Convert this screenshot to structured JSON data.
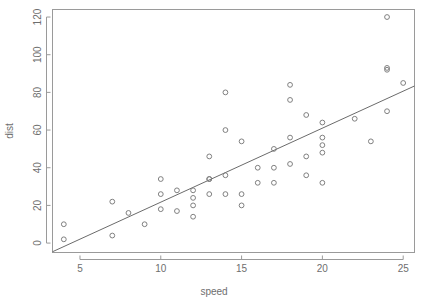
{
  "chart_data": {
    "type": "scatter",
    "title": "",
    "subtitle": "",
    "xlabel": "speed",
    "ylabel": "dist",
    "xlim": [
      3.3,
      25.7
    ],
    "ylim": [
      -5,
      124
    ],
    "grid": false,
    "legend": null,
    "x_ticks": [
      5,
      10,
      15,
      20,
      25
    ],
    "x_tick_labels": [
      "5",
      "10",
      "15",
      "20",
      "25"
    ],
    "y_ticks": [
      0,
      20,
      40,
      60,
      80,
      100,
      120
    ],
    "y_tick_labels": [
      "0",
      "20",
      "40",
      "60",
      "80",
      "100",
      "120"
    ],
    "marker": "open-circle",
    "marker_color": "#808080",
    "x": [
      4,
      4,
      7,
      7,
      8,
      9,
      10,
      10,
      10,
      11,
      11,
      12,
      12,
      12,
      12,
      13,
      13,
      13,
      13,
      14,
      14,
      14,
      14,
      15,
      15,
      15,
      16,
      16,
      17,
      17,
      17,
      18,
      18,
      18,
      18,
      19,
      19,
      19,
      20,
      20,
      20,
      20,
      20,
      22,
      23,
      24,
      24,
      24,
      24,
      25
    ],
    "y": [
      2,
      10,
      4,
      22,
      16,
      10,
      18,
      26,
      34,
      17,
      28,
      14,
      20,
      24,
      28,
      26,
      34,
      34,
      46,
      26,
      36,
      60,
      80,
      20,
      26,
      54,
      32,
      40,
      32,
      40,
      50,
      42,
      56,
      76,
      84,
      36,
      46,
      68,
      32,
      48,
      52,
      56,
      64,
      66,
      54,
      70,
      92,
      93,
      120,
      85
    ],
    "series": [
      {
        "name": "cars",
        "x": [
          4,
          4,
          7,
          7,
          8,
          9,
          10,
          10,
          10,
          11,
          11,
          12,
          12,
          12,
          12,
          13,
          13,
          13,
          13,
          14,
          14,
          14,
          14,
          15,
          15,
          15,
          16,
          16,
          17,
          17,
          17,
          18,
          18,
          18,
          18,
          19,
          19,
          19,
          20,
          20,
          20,
          20,
          20,
          22,
          23,
          24,
          24,
          24,
          24,
          25
        ],
        "values": [
          2,
          10,
          4,
          22,
          16,
          10,
          18,
          26,
          34,
          17,
          28,
          14,
          20,
          24,
          28,
          26,
          34,
          34,
          46,
          26,
          36,
          60,
          80,
          20,
          26,
          54,
          32,
          40,
          32,
          40,
          50,
          42,
          56,
          76,
          84,
          36,
          46,
          68,
          32,
          48,
          52,
          56,
          64,
          66,
          54,
          70,
          92,
          93,
          120,
          85
        ]
      }
    ],
    "fit_line": {
      "name": "linear regression",
      "intercept": -17.58,
      "slope": 3.93,
      "x_start": 3.3,
      "x_end": 25.7,
      "y_start": -4.6,
      "y_end": 83.4
    },
    "annotations": []
  },
  "axes": {
    "x_title": "speed",
    "y_title": "dist"
  }
}
